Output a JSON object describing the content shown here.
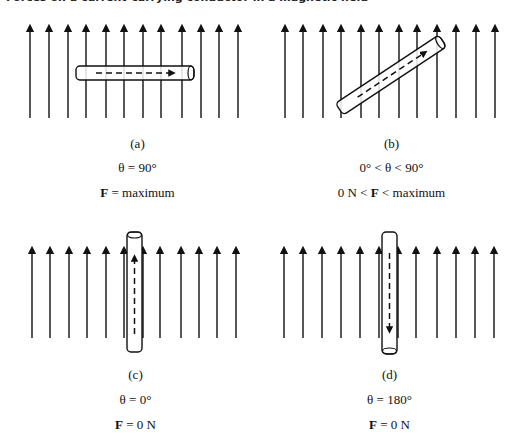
{
  "caption_top": "Forces on a current-carrying conductor in a magnetic field",
  "panels": [
    {
      "id": "a",
      "label": "(a)",
      "angle_text": "θ = 90°",
      "force_prefix": "",
      "force_symbol": "F",
      "force_suffix": " = maximum",
      "conductor_orientation": "horizontal",
      "current_direction": "right"
    },
    {
      "id": "b",
      "label": "(b)",
      "angle_text": "0° < θ < 90°",
      "force_prefix": "0 N < ",
      "force_symbol": "F",
      "force_suffix": " < maximum",
      "conductor_orientation": "tilted",
      "current_direction": "up-right"
    },
    {
      "id": "c",
      "label": "(c)",
      "angle_text": "θ = 0°",
      "force_prefix": "",
      "force_symbol": "F",
      "force_suffix": " = 0 N",
      "conductor_orientation": "vertical",
      "current_direction": "up"
    },
    {
      "id": "d",
      "label": "(d)",
      "angle_text": "θ = 180°",
      "force_prefix": "",
      "force_symbol": "F",
      "force_suffix": " = 0 N",
      "conductor_orientation": "vertical",
      "current_direction": "down"
    }
  ],
  "field_lines_per_panel": 12,
  "colors": {
    "line": "#111111",
    "background": "#ffffff"
  }
}
